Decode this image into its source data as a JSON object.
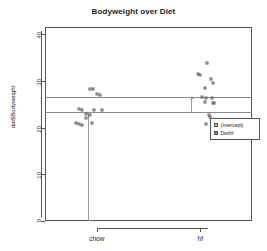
{
  "chart_data": {
    "type": "scatter",
    "title": "Bodyweight over Diet",
    "xlabel": "",
    "ylabel": "dat$Bodyweight",
    "categories": [
      "chow",
      "hf"
    ],
    "xtick_labels": [
      "chow",
      "hf"
    ],
    "ytick_labels": [
      "0",
      "10",
      "20",
      "30",
      "40"
    ],
    "ytick_values": [
      0,
      10,
      20,
      30,
      40
    ],
    "ylim": [
      0,
      41.5
    ],
    "grid": false,
    "legend_position": "right",
    "legend": [
      {
        "label": "(Intercept)",
        "swatch": "#bdbdbd"
      },
      {
        "label": "Diethf",
        "swatch": "#8a8a8a"
      }
    ],
    "series": [
      {
        "name": "chow",
        "x_category": "chow",
        "points": [
          {
            "x": 0.93,
            "y": 28.3
          },
          {
            "x": 0.96,
            "y": 28.2
          },
          {
            "x": 1.0,
            "y": 27.2
          },
          {
            "x": 1.03,
            "y": 27.0
          },
          {
            "x": 0.83,
            "y": 23.9
          },
          {
            "x": 0.86,
            "y": 23.7
          },
          {
            "x": 0.97,
            "y": 23.8
          },
          {
            "x": 1.05,
            "y": 23.7
          },
          {
            "x": 0.9,
            "y": 22.9
          },
          {
            "x": 0.93,
            "y": 22.7
          },
          {
            "x": 0.9,
            "y": 22.0
          },
          {
            "x": 0.8,
            "y": 20.9
          },
          {
            "x": 0.83,
            "y": 20.8
          },
          {
            "x": 0.86,
            "y": 20.6
          },
          {
            "x": 0.95,
            "y": 21.0
          }
        ]
      },
      {
        "name": "hf",
        "x_category": "hf",
        "points": [
          {
            "x": 2.07,
            "y": 33.9
          },
          {
            "x": 1.98,
            "y": 31.5
          },
          {
            "x": 2.0,
            "y": 31.3
          },
          {
            "x": 2.1,
            "y": 30.3
          },
          {
            "x": 2.12,
            "y": 29.6
          },
          {
            "x": 2.05,
            "y": 28.5
          },
          {
            "x": 2.02,
            "y": 26.6
          },
          {
            "x": 2.06,
            "y": 26.3
          },
          {
            "x": 2.11,
            "y": 26.4
          },
          {
            "x": 2.05,
            "y": 25.4
          },
          {
            "x": 2.12,
            "y": 25.3
          },
          {
            "x": 2.13,
            "y": 25.2
          },
          {
            "x": 2.08,
            "y": 22.6
          },
          {
            "x": 2.09,
            "y": 22.2
          },
          {
            "x": 2.06,
            "y": 20.7
          }
        ]
      }
    ],
    "reference_lines": [
      {
        "name": "intercept-plus-effect",
        "y": 26.5
      },
      {
        "name": "intercept",
        "y": 23.4
      },
      {
        "name": "zero",
        "y": 0
      }
    ],
    "arrows": [
      {
        "name": "intercept-arrow",
        "x_category": "chow",
        "y_start": 0,
        "y_end": 23.4
      },
      {
        "name": "diethf-arrow",
        "x_category": "hf",
        "y_start": 23.4,
        "y_end": 26.5
      }
    ]
  }
}
